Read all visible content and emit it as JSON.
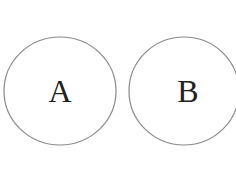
{
  "diagram": {
    "stroke_color": "#8a8a8a",
    "circles": [
      {
        "label": "A",
        "cx": 60,
        "cy": 91,
        "rx": 56,
        "ry": 54
      },
      {
        "label": "B",
        "cx": 184,
        "cy": 91,
        "rx": 55,
        "ry": 54
      }
    ]
  }
}
